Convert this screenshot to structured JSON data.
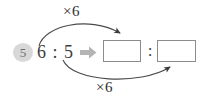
{
  "diagram": {
    "type": "ratio-scaling",
    "step_badge": "5",
    "source_ratio": {
      "left_term": "6",
      "separator": ":",
      "right_term": "5",
      "text": "6 : 5"
    },
    "transform_arrow": "block-arrow-right",
    "result_ratio": {
      "left_box_value": "",
      "separator": ":",
      "right_box_value": ""
    },
    "labels": {
      "top_operation": "×6",
      "bottom_operation": "×6"
    },
    "colors": {
      "badge_fill": "#d8d8d8",
      "badge_text": "#6e6e6e",
      "text": "#3d3d3d",
      "box_border": "#8c8c8c",
      "block_arrow": "#b4b4b4",
      "curve_stroke": "#4a4a4a",
      "background": "#ffffff"
    }
  }
}
